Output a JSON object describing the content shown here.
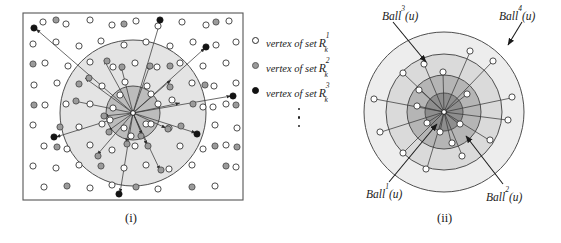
{
  "figure": {
    "type": "diagram",
    "background_color": "#ffffff",
    "stroke_color": "#2b2b2b"
  },
  "panels": [
    {
      "id": "i",
      "caption": "(i)",
      "caption_x": 131,
      "caption_y": 212
    },
    {
      "id": "ii",
      "caption": "(ii)",
      "caption_x": 443,
      "caption_y": 212
    }
  ],
  "legend": {
    "items": [
      {
        "marker": "open-circle",
        "text": "vertex of set",
        "symbol": "R",
        "superscript": "1",
        "subscript": "k",
        "color": "#ffffff"
      },
      {
        "marker": "gray-circle",
        "text": "vertex of set",
        "symbol": "R",
        "superscript": "2",
        "subscript": "k",
        "color": "#9a9a9a"
      },
      {
        "marker": "black-circle",
        "text": "vertex of set",
        "symbol": "R",
        "superscript": "3",
        "subscript": "k",
        "color": "#111111"
      }
    ],
    "continuation": "vertical-ellipsis",
    "continuation_dots": 3
  },
  "panel_i": {
    "frame": {
      "x": 23,
      "y": 13,
      "width": 220,
      "height": 187,
      "stroke": "#4a4a4a"
    },
    "center": {
      "x": 133,
      "y": 113,
      "label": "u"
    },
    "circles": [
      {
        "name": "outer-ball",
        "r": 73,
        "fill": "#e2e2e2",
        "stroke": "#4a4a4a"
      },
      {
        "name": "inner-ball",
        "r": 27,
        "fill": "#b9b9b9",
        "stroke": "#4a4a4a"
      }
    ],
    "vertex_counts": {
      "open": 96,
      "gray": 34,
      "black": 7
    },
    "ray_count": 22
  },
  "panel_ii": {
    "center": {
      "x": 444,
      "y": 112,
      "label": "u"
    },
    "circles": [
      {
        "name": "Ball4",
        "r": 80,
        "fill": "#ededed",
        "stroke": "#4a4a4a"
      },
      {
        "name": "Ball3",
        "r": 58,
        "fill": "#d9d9d9",
        "stroke": "#4a4a4a"
      },
      {
        "name": "Ball2",
        "r": 37,
        "fill": "#b6b6b6",
        "stroke": "#4a4a4a"
      },
      {
        "name": "Ball1",
        "r": 19,
        "fill": "#8f8f8f",
        "stroke": "#4a4a4a"
      }
    ],
    "labels": [
      {
        "text": "Ball",
        "superscript": "3",
        "suffix": "(u)",
        "x": 382,
        "y": 10,
        "arrow_to_x": 424,
        "arrow_to_y": 64
      },
      {
        "text": "Ball",
        "superscript": "4",
        "suffix": "(u)",
        "x": 499,
        "y": 10,
        "arrow_to_x": 505,
        "arrow_to_y": 47
      },
      {
        "text": "Ball",
        "superscript": "1",
        "suffix": "(u)",
        "x": 368,
        "y": 187,
        "arrow_to_x": 440,
        "arrow_to_y": 122
      },
      {
        "text": "Ball",
        "superscript": "2",
        "suffix": "(u)",
        "x": 487,
        "y": 190,
        "arrow_to_x": 463,
        "arrow_to_y": 135
      }
    ],
    "vertex_count": 20,
    "ray_count": 20
  }
}
